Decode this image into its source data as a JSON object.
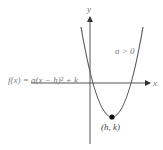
{
  "diagram": {
    "equation_label": "f(x) = a(x − h)² + k",
    "condition_label": "a > 0",
    "vertex_label": "(h, k)",
    "x_axis_label": "x",
    "y_axis_label": "y",
    "colors": {
      "axis": "#555555",
      "curve": "#555555",
      "vertex_point": "#111111",
      "label_gray": "#7a7a7a",
      "label_dark": "#444444"
    }
  }
}
